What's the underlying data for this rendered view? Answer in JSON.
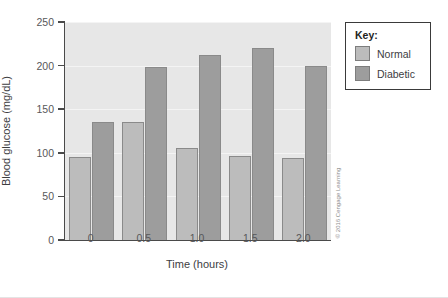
{
  "chart_data": {
    "type": "bar",
    "title": "",
    "xlabel": "Time (hours)",
    "ylabel": "Blood glucose (mg/dL)",
    "categories": [
      "0",
      "0.5",
      "1.0",
      "1.5",
      "2.0"
    ],
    "series": [
      {
        "name": "Normal",
        "color": "#bcbcbc",
        "values": [
          95,
          135,
          105,
          96,
          94
        ]
      },
      {
        "name": "Diabetic",
        "color": "#9d9d9d",
        "values": [
          135,
          198,
          212,
          220,
          200
        ]
      }
    ],
    "ylim": [
      0,
      250
    ],
    "yticks": [
      0,
      50,
      100,
      150,
      200,
      250
    ],
    "ytick_labels": [
      "0",
      "50",
      "100",
      "150",
      "200",
      "250"
    ],
    "grid": true,
    "legend_position": "right-top"
  },
  "legend": {
    "title": "Key:",
    "entries": [
      {
        "label": "Normal"
      },
      {
        "label": "Diabetic"
      }
    ]
  },
  "credit": {
    "text": "© 2016 Cengage Learning"
  }
}
